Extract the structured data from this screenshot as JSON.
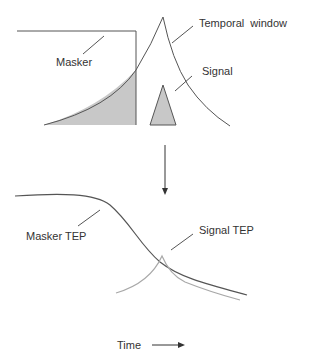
{
  "top_panel": {
    "labels": {
      "masker": "Masker",
      "temporal_window": "Temporal  window",
      "signal": "Signal"
    }
  },
  "bottom_panel": {
    "labels": {
      "masker_tep": "Masker TEP",
      "signal_tep": "Signal TEP"
    }
  },
  "axis": {
    "time_label": "Time"
  },
  "colors": {
    "line": "#555555",
    "fill": "#c8c8c8",
    "light_curve": "#a8a8a8"
  }
}
